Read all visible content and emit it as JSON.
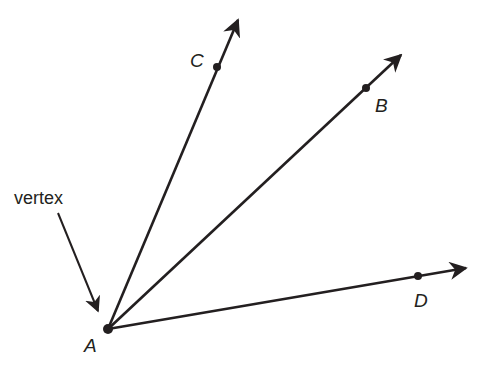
{
  "diagram": {
    "title": "",
    "colors": {
      "stroke": "#231f20",
      "background": "#ffffff"
    },
    "vertex": {
      "label": "A",
      "x": 108,
      "y": 329
    },
    "rays": [
      {
        "label": "C",
        "point": {
          "x": 217,
          "y": 67
        },
        "tip": {
          "x": 240,
          "y": 16
        }
      },
      {
        "label": "B",
        "point": {
          "x": 366,
          "y": 88
        },
        "tip": {
          "x": 404,
          "y": 52
        }
      },
      {
        "label": "D",
        "point": {
          "x": 418,
          "y": 276
        },
        "tip": {
          "x": 470,
          "y": 268
        }
      }
    ],
    "annotation": {
      "text": "vertex",
      "target": "A"
    }
  }
}
